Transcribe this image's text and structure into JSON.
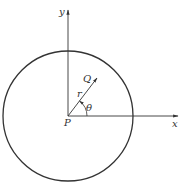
{
  "diagram": {
    "type": "polar-coordinates-circle",
    "labels": {
      "y_axis": "y",
      "x_axis": "x",
      "origin": "P",
      "point": "Q",
      "radius": "r",
      "angle": "θ"
    },
    "colors": {
      "stroke": "#333333",
      "background": "#ffffff"
    }
  }
}
